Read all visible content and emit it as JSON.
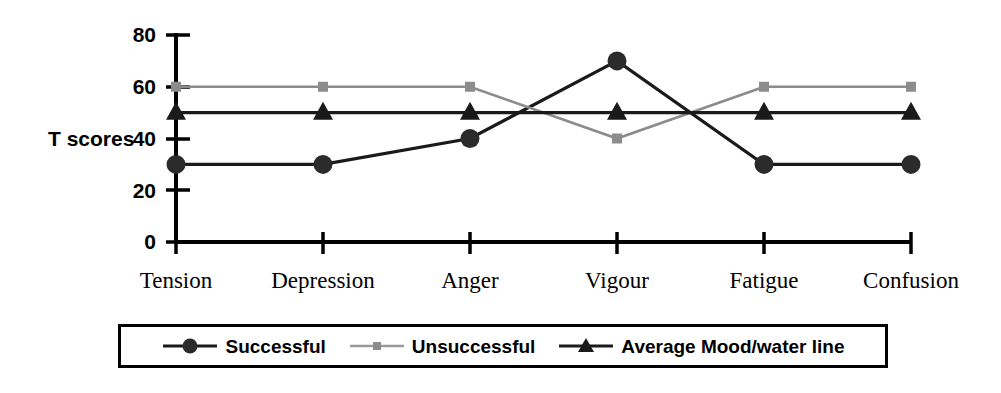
{
  "chart_data": {
    "type": "line",
    "title": "",
    "xlabel": "",
    "ylabel": "T scores",
    "ylim": [
      0,
      80
    ],
    "yticks": [
      0,
      20,
      40,
      60,
      80
    ],
    "ytick_labels": [
      "0",
      "20",
      "40",
      "60",
      "80"
    ],
    "grid": false,
    "legend_position": "bottom",
    "categories": [
      "Tension",
      "Depression",
      "Anger",
      "Vigour",
      "Fatigue",
      "Confusion"
    ],
    "series": [
      {
        "name": "Successful",
        "values": [
          30,
          30,
          40,
          70,
          30,
          30
        ],
        "color": "#1a1a1a",
        "marker": "circle",
        "marker_label": "filled-circle-marker"
      },
      {
        "name": "Unsuccessful",
        "values": [
          60,
          60,
          60,
          40,
          60,
          60
        ],
        "color": "#8c8c8c",
        "marker": "square",
        "marker_label": "small-square-marker"
      },
      {
        "name": "Average Mood/water line",
        "values": [
          50,
          50,
          50,
          50,
          50,
          50
        ],
        "color": "#1a1a1a",
        "marker": "triangle",
        "marker_label": "filled-triangle-marker"
      }
    ]
  },
  "axes": {
    "y_title": "T scores",
    "y_tick_0": "0",
    "y_tick_20": "20",
    "y_tick_40": "40",
    "y_tick_60": "60",
    "y_tick_80": "80"
  },
  "categories": {
    "c0": "Tension",
    "c1": "Depression",
    "c2": "Anger",
    "c3": "Vigour",
    "c4": "Fatigue",
    "c5": "Confusion"
  },
  "legend": {
    "items": [
      {
        "label": "Successful"
      },
      {
        "label": "Unsuccessful"
      },
      {
        "label": "Average Mood/water line"
      }
    ]
  },
  "colors": {
    "successful": "#1a1a1a",
    "unsuccessful": "#8c8c8c",
    "average": "#1a1a1a",
    "axis": "#000000",
    "background": "#ffffff"
  }
}
